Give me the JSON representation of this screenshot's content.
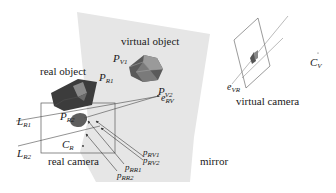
{
  "diagram": {
    "type": "mirror-camera-geometry",
    "colors": {
      "mirror_fill": "#e4e4e4",
      "object_dark": "#3a3a3a",
      "object_mid": "#6a6a6a",
      "object_light": "#9a9a9a",
      "line": "#4a4a4a",
      "camera_blob": "#5a5a5a"
    },
    "labels": {
      "virtual_object": "virtual object",
      "real_object": "real object",
      "real_camera": "real camera",
      "virtual_camera": "virtual camera",
      "mirror": "mirror"
    },
    "symbols": {
      "P_V1": {
        "base": "P",
        "sub": "V1"
      },
      "P_V2": {
        "base": "P",
        "sub": "V2"
      },
      "P_R1": {
        "base": "P",
        "sub": "R1"
      },
      "P_R2": {
        "base": "P",
        "sub": "R2"
      },
      "L_R1": {
        "base": "L",
        "sub": "R1"
      },
      "L_R2": {
        "base": "L",
        "sub": "R2"
      },
      "C_R": {
        "base": "C",
        "sub": "R"
      },
      "C_V": {
        "base": "C",
        "sub": "V"
      },
      "e_RV": {
        "base": "e",
        "sub": "RV"
      },
      "e_VR": {
        "base": "e",
        "sub": "VR"
      },
      "p_RV1": {
        "base": "p",
        "sub": "RV1"
      },
      "p_RV2": {
        "base": "p",
        "sub": "RV2"
      },
      "p_RR1": {
        "base": "p",
        "sub": "RR1"
      },
      "p_RR2": {
        "base": "p",
        "sub": "RR2"
      }
    }
  }
}
